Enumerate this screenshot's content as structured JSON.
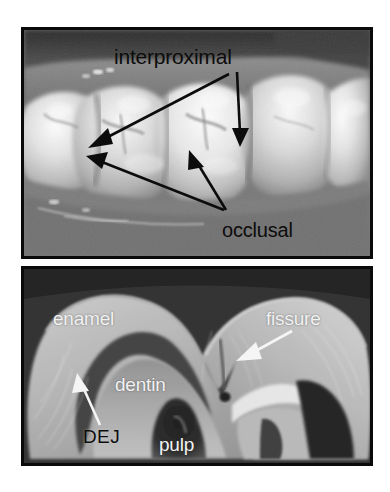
{
  "figure": {
    "background_color": "#ffffff",
    "border_color": "#0a0a0a"
  },
  "panels": [
    {
      "id": "occlusal-photo",
      "kind": "intraoral-photograph",
      "caption": "Intraoral photograph of posterior teeth in occlusion",
      "annotation_color": "#0c0c0c",
      "labels": [
        {
          "name": "interproximal",
          "text": "interproximal",
          "color": "#0c0c0c",
          "style": "dark"
        },
        {
          "name": "occlusal",
          "text": "occlusal",
          "color": "#0c0c0c",
          "style": "dark"
        }
      ],
      "arrows": [
        {
          "name": "interproximal-arrow-vertical",
          "from_label": "interproximal",
          "points_to": "interproximal contact between right teeth"
        },
        {
          "name": "interproximal-arrow-diagonal",
          "from_label": "interproximal",
          "points_to": "interproximal contact between left teeth"
        },
        {
          "name": "occlusal-arrow-left",
          "from_label": "occlusal",
          "points_to": "occlusal surface of first molar"
        },
        {
          "name": "occlusal-arrow-right",
          "from_label": "occlusal",
          "points_to": "occlusal surface of second molar"
        }
      ]
    },
    {
      "id": "tooth-cross-section",
      "kind": "ground-section-micrograph",
      "caption": "Longitudinal ground section of a molar crown",
      "annotation_color": "#f2f2f2",
      "labels": [
        {
          "name": "enamel",
          "text": "enamel",
          "color": "#f2f2f2",
          "style": "light"
        },
        {
          "name": "fissure",
          "text": "fissure",
          "color": "#f2f2f2",
          "style": "light"
        },
        {
          "name": "dentin",
          "text": "dentin",
          "color": "#f2f2f2",
          "style": "light"
        },
        {
          "name": "dej",
          "text": "DEJ",
          "color": "#0c0c0c",
          "style": "dark"
        },
        {
          "name": "pulp",
          "text": "pulp",
          "color": "#f2f2f2",
          "style": "light"
        }
      ],
      "arrows": [
        {
          "name": "fissure-arrow",
          "from_label": "fissure",
          "points_to": "occlusal fissure at enamel surface",
          "color": "#f5f5f5"
        },
        {
          "name": "dej-arrow",
          "from_label": "DEJ",
          "points_to": "dentino-enamel junction",
          "color": "#f5f5f5"
        }
      ]
    }
  ]
}
